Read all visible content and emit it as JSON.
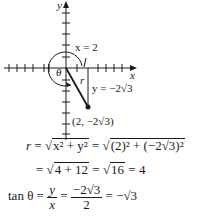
{
  "diagram": {
    "axis_labels": {
      "x": "x",
      "y": "y"
    },
    "angle_label": "θ",
    "radius_label": "r",
    "line_labels": {
      "vertical": "x = 2",
      "horizontal_leg": "y = −2√3"
    },
    "point": {
      "label": "(2, −2√3)",
      "x": 2,
      "y": "-2√3"
    }
  },
  "equations": {
    "r_line1": {
      "lhs": "r",
      "eq1": " = ",
      "sqrt1": "x² + y²",
      "eq2": " = ",
      "sqrt2": "(2)² + (−2√3)²"
    },
    "r_line2": {
      "eq": "= ",
      "sqrt1": "4 + 12",
      "eq2": " = ",
      "sqrt2": "16",
      "result": " = 4"
    },
    "tan_line": {
      "lhs": "tan θ = ",
      "frac1_num": "y",
      "frac1_den": "x",
      "eq1": " = ",
      "frac2_num": "−2√3",
      "frac2_den": "2",
      "result": " = −√3"
    }
  },
  "colors": {
    "ink": "#1a1a1a",
    "background": "#ffffff"
  }
}
